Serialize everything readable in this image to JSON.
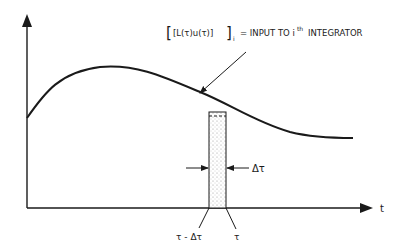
{
  "diagram": {
    "annotation": {
      "expression": "[L(τ)u(τ)]",
      "subscript": "i",
      "equals_text": "= INPUT TO i",
      "superscript": "th",
      "tail_text": "INTEGRATOR"
    },
    "x_axis_label": "t",
    "width_label": "Δτ",
    "strip_left_label": "τ - Δτ",
    "strip_right_label": "τ",
    "colors": {
      "ink": "#1a1a1a",
      "background": "#ffffff",
      "stipple": "#9a9a9a"
    }
  }
}
